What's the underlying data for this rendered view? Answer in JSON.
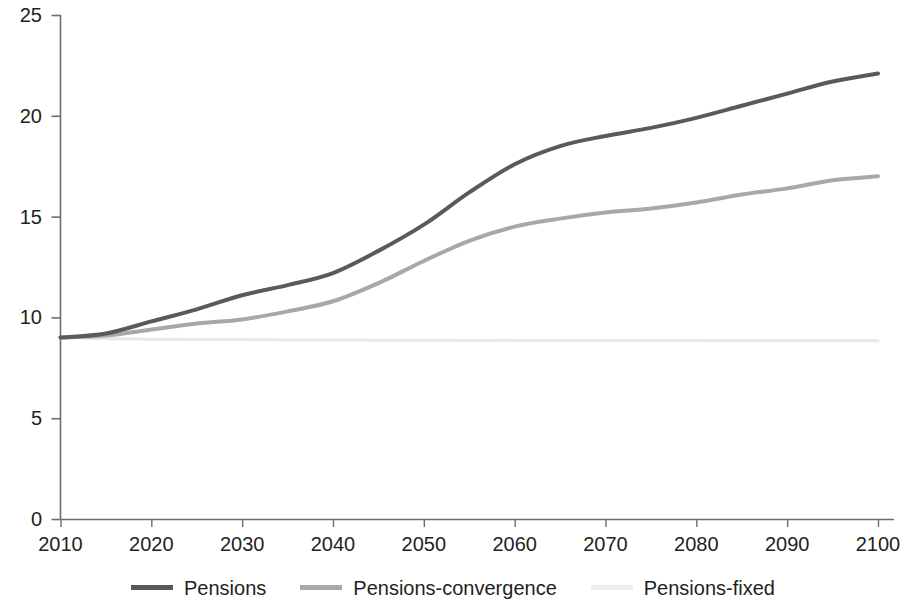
{
  "chart_data": {
    "type": "line",
    "title": "",
    "subtitle": "",
    "xlabel": "",
    "ylabel": "",
    "xlim": [
      2010,
      2100
    ],
    "ylim": [
      0,
      25
    ],
    "grid": false,
    "legend_position": "bottom-center",
    "x_ticks": [
      "2010",
      "2020",
      "2030",
      "2040",
      "2050",
      "2060",
      "2070",
      "2080",
      "2090",
      "2100"
    ],
    "y_ticks": [
      "0",
      "5",
      "10",
      "15",
      "20",
      "25"
    ],
    "x": [
      2010,
      2015,
      2020,
      2025,
      2030,
      2035,
      2040,
      2045,
      2050,
      2055,
      2060,
      2065,
      2070,
      2075,
      2080,
      2085,
      2090,
      2095,
      2100
    ],
    "series": [
      {
        "name": "Pensions",
        "color": "#5a5a5a",
        "width": 4.0,
        "values": [
          9.0,
          9.2,
          9.8,
          10.4,
          11.1,
          11.6,
          12.2,
          13.3,
          14.6,
          16.2,
          17.6,
          18.5,
          19.0,
          19.4,
          19.9,
          20.5,
          21.1,
          21.7,
          22.1
        ]
      },
      {
        "name": "Pensions-convergence",
        "color": "#a8a8a8",
        "width": 4.0,
        "values": [
          9.0,
          9.1,
          9.4,
          9.7,
          9.9,
          10.3,
          10.8,
          11.7,
          12.8,
          13.8,
          14.5,
          14.9,
          15.2,
          15.4,
          15.7,
          16.1,
          16.4,
          16.8,
          17.0
        ]
      },
      {
        "name": "Pensions-fixed",
        "color": "#e7e7e7",
        "width": 3.0,
        "values": [
          9.0,
          8.95,
          8.92,
          8.9,
          8.9,
          8.88,
          8.88,
          8.87,
          8.87,
          8.86,
          8.86,
          8.85,
          8.85,
          8.85,
          8.85,
          8.84,
          8.84,
          8.84,
          8.84
        ]
      }
    ]
  },
  "axes": {
    "line_color": "#6d6d6d",
    "text_color": "#231f20"
  },
  "legend": {
    "items": [
      {
        "label": "Pensions",
        "color": "#5a5a5a"
      },
      {
        "label": "Pensions-convergence",
        "color": "#a8a8a8"
      },
      {
        "label": "Pensions-fixed",
        "color": "#ededed"
      }
    ]
  }
}
